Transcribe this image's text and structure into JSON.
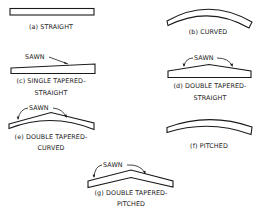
{
  "figure": {
    "panels": [
      {
        "id": "a",
        "caption_lines": [
          "(a) STRAIGHT"
        ]
      },
      {
        "id": "b",
        "caption_lines": [
          "(b) CURVED"
        ]
      },
      {
        "id": "c",
        "caption_lines": [
          "(c) SINGLE TAPERED-",
          "STRAIGHT"
        ],
        "annotation": "SAWN"
      },
      {
        "id": "d",
        "caption_lines": [
          "(d) DOUBLE TAPERED-",
          "STRAIGHT"
        ],
        "annotation": "SAWN"
      },
      {
        "id": "e",
        "caption_lines": [
          "(e) DOUBLE TAPERED-",
          "CURVED"
        ],
        "annotation": "SAWN"
      },
      {
        "id": "f",
        "caption_lines": [
          "(f) PITCHED"
        ]
      },
      {
        "id": "g",
        "caption_lines": [
          "(g) DOUBLE TAPERED-",
          "PITCHED"
        ],
        "annotation": "SAWN"
      }
    ]
  },
  "colors": {
    "ink": "#1a1a1a",
    "background": "#ffffff"
  }
}
